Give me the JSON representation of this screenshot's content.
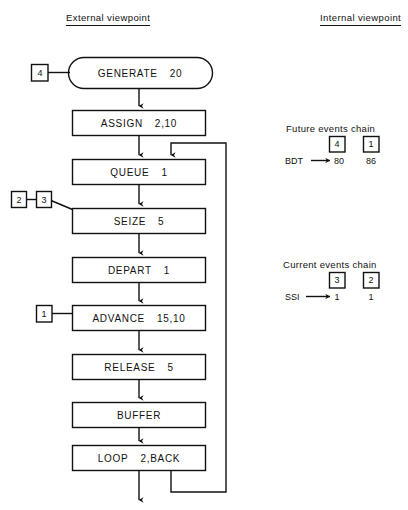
{
  "headers": {
    "external": "External viewpoint",
    "internal": "Internal viewpoint"
  },
  "colors": {
    "ink": "#111111",
    "background": "#ffffff"
  },
  "flowchart": {
    "blocks": [
      {
        "id": "generate",
        "shape": "stadium",
        "op": "GENERATE",
        "arg": "20"
      },
      {
        "id": "assign",
        "shape": "rect",
        "op": "ASSIGN",
        "arg": "2,10"
      },
      {
        "id": "queue",
        "shape": "rect",
        "op": "QUEUE",
        "arg": "1"
      },
      {
        "id": "seize",
        "shape": "rect",
        "op": "SEIZE",
        "arg": "5"
      },
      {
        "id": "depart",
        "shape": "rect",
        "op": "DEPART",
        "arg": "1"
      },
      {
        "id": "advance",
        "shape": "rect",
        "op": "ADVANCE",
        "arg": "15,10"
      },
      {
        "id": "release",
        "shape": "rect",
        "op": "RELEASE",
        "arg": "5"
      },
      {
        "id": "buffer",
        "shape": "rect",
        "op": "BUFFER",
        "arg": ""
      },
      {
        "id": "loop",
        "shape": "rect",
        "op": "LOOP",
        "arg": "2,BACK"
      }
    ],
    "transaction_tags": [
      {
        "id": "tag-generate",
        "label": "4",
        "attached_to": "generate"
      },
      {
        "id": "tag-seize-2",
        "label": "2",
        "attached_to": "seize"
      },
      {
        "id": "tag-seize-3",
        "label": "3",
        "attached_to": "seize"
      },
      {
        "id": "tag-advance",
        "label": "1",
        "attached_to": "advance"
      }
    ]
  },
  "chains": {
    "future": {
      "title": "Future events chain",
      "clock_label": "BDT",
      "entries": [
        {
          "tag": "4",
          "value": "80"
        },
        {
          "tag": "1",
          "value": "86"
        }
      ]
    },
    "current": {
      "title": "Current events chain",
      "clock_label": "SSI",
      "entries": [
        {
          "tag": "3",
          "value": "1"
        },
        {
          "tag": "2",
          "value": "1"
        }
      ]
    }
  }
}
